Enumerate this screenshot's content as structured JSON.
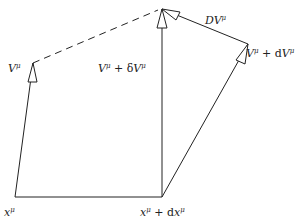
{
  "diagram": {
    "labels": {
      "base_point": "x^μ",
      "displaced_point": "x^μ + dx^μ",
      "vector": "V^μ",
      "parallel_transported": "V^μ + δV^μ",
      "displaced_vector": "V^μ + dV^μ",
      "covariant_difference": "DV^μ"
    },
    "label_text": {
      "base_point": {
        "main": "x",
        "sup": "μ"
      },
      "displaced_point": {
        "main": "x",
        "sup": "μ",
        "rest": " + d",
        "main2": "x",
        "sup2": "μ"
      },
      "vector": {
        "main": "V",
        "sup": "μ"
      },
      "parallel_transported": {
        "main": "V",
        "sup": "μ",
        "rest": " + δ",
        "main2": "V",
        "sup2": "μ"
      },
      "displaced_vector": {
        "main": "V",
        "sup": "μ",
        "rest": " + d",
        "main2": "V",
        "sup2": "μ"
      },
      "covariant_difference": {
        "main": "DV",
        "sup": "μ"
      }
    },
    "colors": {
      "stroke": "#222222",
      "background": "#ffffff"
    }
  }
}
